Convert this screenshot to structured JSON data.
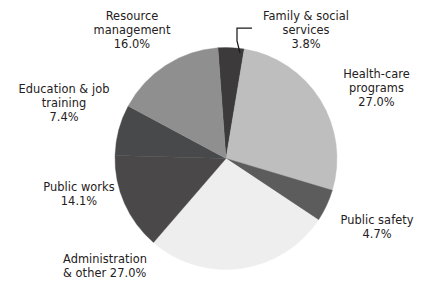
{
  "chart_data": {
    "type": "pie",
    "title": "",
    "subtitle": "",
    "xlabel": "",
    "ylabel": "",
    "units": "percent",
    "legend_position": "none",
    "label_style": "outside-with-percent",
    "grid": false,
    "start_angle_deg": -4.2,
    "direction": "clockwise",
    "center": {
      "cx": 226,
      "cy": 158.5,
      "r": 111
    },
    "categories": [
      "Family & social services",
      "Health-care programs",
      "Public safety",
      "Administration & other",
      "Public works",
      "Education & job training",
      "Resource management"
    ],
    "values": [
      3.8,
      27.0,
      4.7,
      27.0,
      14.1,
      7.4,
      16.0
    ],
    "colors": [
      "#3c3a3b",
      "#bebebe",
      "#5d5c5c",
      "#eeeeee",
      "#4a4849",
      "#48494a",
      "#8f8f8f"
    ],
    "slices": [
      {
        "name": "Family & social services",
        "value": 3.8,
        "value_text": "3.8%",
        "color": "#3c3a3b",
        "label_lines": [
          "Family & social",
          "services",
          "3.8%"
        ],
        "has_leader_line": true
      },
      {
        "name": "Health-care programs",
        "value": 27.0,
        "value_text": "27.0%",
        "color": "#bebebe",
        "label_lines": [
          "Health-care",
          "programs",
          "27.0%"
        ],
        "has_leader_line": false
      },
      {
        "name": "Public safety",
        "value": 4.7,
        "value_text": "4.7%",
        "color": "#5d5c5c",
        "label_lines": [
          "Public safety",
          "4.7%"
        ],
        "has_leader_line": false
      },
      {
        "name": "Administration & other",
        "value": 27.0,
        "value_text": "27.0%",
        "color": "#eeeeee",
        "label_lines": [
          "Administration",
          "& other 27.0%"
        ],
        "has_leader_line": false
      },
      {
        "name": "Public works",
        "value": 14.1,
        "value_text": "14.1%",
        "color": "#4a4849",
        "label_lines": [
          "Public works",
          "14.1%"
        ],
        "has_leader_line": false
      },
      {
        "name": "Education & job training",
        "value": 7.4,
        "value_text": "7.4%",
        "color": "#48494a",
        "label_lines": [
          "Education & job",
          "training",
          "7.4%"
        ],
        "has_leader_line": false
      },
      {
        "name": "Resource management",
        "value": 16.0,
        "value_text": "16.0%",
        "color": "#8f8f8f",
        "label_lines": [
          "Resource",
          "management",
          "16.0%"
        ],
        "has_leader_line": false
      }
    ]
  },
  "labels": {
    "resource_management": "Resource\nmanagement\n16.0%",
    "family_social": "Family & social\nservices\n3.8%",
    "health_care": "Health-care\nprograms\n27.0%",
    "education_job": "Education & job\ntraining\n7.4%",
    "public_works": "Public works\n14.1%",
    "public_safety": "Public safety\n4.7%",
    "administration": "Administration\n& other 27.0%"
  },
  "colors": {
    "background": "#ffffff",
    "text": "#242021",
    "leader_line": "#1b1b1b"
  }
}
